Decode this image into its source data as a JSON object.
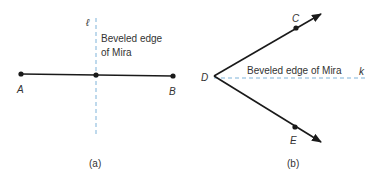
{
  "figure_a": {
    "caption": "(a)",
    "line_label": "ℓ",
    "edge_label_line1": "Beveled edge",
    "edge_label_line2": "of Mira",
    "point_a": "A",
    "point_b": "B"
  },
  "figure_b": {
    "caption": "(b)",
    "line_label": "k",
    "edge_label": "Beveled edge of Mira",
    "point_c": "C",
    "point_d": "D",
    "point_e": "E"
  },
  "colors": {
    "segment": "#1a1a1a",
    "dashed_mira": "#7fb3d9",
    "text": "#333333"
  }
}
